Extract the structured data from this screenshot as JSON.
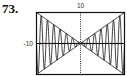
{
  "problem_number": "73.",
  "chart_data": {
    "type": "line",
    "title": "",
    "xlabel": "",
    "ylabel": "",
    "xlim": [
      -10,
      10
    ],
    "ylim": [
      -10,
      10
    ],
    "grid": false,
    "tick_labels": {
      "x_left": "-10",
      "y_top": "10"
    },
    "series": [
      {
        "name": "y = x",
        "function": "x"
      },
      {
        "name": "y = -x",
        "function": "-x"
      },
      {
        "name": "oscillating curve",
        "function": "x*sin(4.4x)",
        "cycles_per_half": 7
      }
    ]
  }
}
